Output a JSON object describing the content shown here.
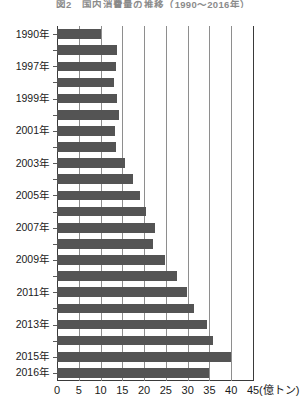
{
  "chart_data": {
    "type": "bar",
    "orientation": "horizontal",
    "title": "図2　国内消費量の推移（1990〜2016年）",
    "xlabel": "",
    "ylabel": "",
    "unit": "(億トン)",
    "xlim": [
      0,
      45
    ],
    "xticks": [
      0,
      5,
      10,
      15,
      20,
      25,
      30,
      35,
      40,
      45
    ],
    "xtick_labels": [
      "0",
      "5",
      "10",
      "15",
      "20",
      "25",
      "30",
      "35",
      "40",
      "45"
    ],
    "grid": true,
    "legend": false,
    "bar_color": "#545454",
    "categories": [
      "1990年",
      "1996年",
      "1997年",
      "1998年",
      "1999年",
      "2000年",
      "2001年",
      "2002年",
      "2003年",
      "2004年",
      "2005年",
      "2006年",
      "2007年",
      "2008年",
      "2009年",
      "2010年",
      "2011年",
      "2012年",
      "2013年",
      "2014年",
      "2015年",
      "2016年"
    ],
    "visible_category_labels": [
      "1990年",
      "1997年",
      "1999年",
      "2001年",
      "2003年",
      "2005年",
      "2007年",
      "2009年",
      "2011年",
      "2013年",
      "2015年",
      "2016年"
    ],
    "values": [
      10.0,
      13.7,
      13.5,
      13.0,
      13.7,
      14.2,
      13.4,
      13.5,
      15.7,
      17.5,
      19.0,
      20.4,
      22.5,
      22.0,
      24.7,
      27.5,
      29.8,
      31.5,
      34.5,
      35.8,
      39.9,
      35.0
    ],
    "max_value": 39.9,
    "max_category": "2015年",
    "min_value": 10.0,
    "min_category": "1990年"
  },
  "axis": {
    "x_unit_label": "(億トン)"
  }
}
